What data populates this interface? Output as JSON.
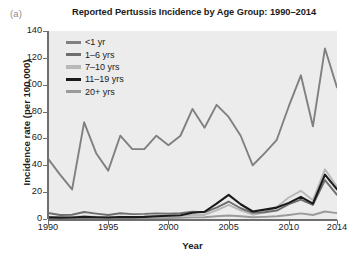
{
  "panel_label": "(a)",
  "axis": {
    "ylabel": "Incidence rate (per 100,000)",
    "xlabel": "Year",
    "yticks": [
      "0",
      "20",
      "40",
      "60",
      "80",
      "100",
      "120",
      "140"
    ],
    "xticks": [
      "1990",
      "1995",
      "2000",
      "2005",
      "2010",
      "2014"
    ]
  },
  "chart_data": {
    "type": "line",
    "title": "Reported Pertussis Incidence by Age Group: 1990–2014",
    "xlabel": "Year",
    "ylabel": "Incidence rate (per 100,000)",
    "xlim": [
      1990,
      2014
    ],
    "ylim": [
      0,
      140
    ],
    "ytick_step": 20,
    "grid": false,
    "legend_position": "top-left-inside",
    "plot_background": "#ececec",
    "x": [
      1990,
      1991,
      1992,
      1993,
      1994,
      1995,
      1996,
      1997,
      1998,
      1999,
      2000,
      2001,
      2002,
      2003,
      2004,
      2005,
      2006,
      2007,
      2008,
      2009,
      2010,
      2011,
      2012,
      2013,
      2014
    ],
    "series": [
      {
        "name": "<1 yr",
        "color": "#808080",
        "values": [
          45,
          33,
          22,
          72,
          49,
          36,
          62,
          52,
          52,
          62,
          55,
          62,
          82,
          68,
          85,
          76,
          62,
          40,
          49,
          59,
          84,
          107,
          69,
          127,
          98
        ]
      },
      {
        "name": "1–6 yrs",
        "color": "#6e6e6e",
        "values": [
          4.5,
          3.0,
          3.2,
          5.2,
          4.0,
          3.0,
          4.3,
          3.6,
          3.8,
          4.2,
          4.0,
          4.4,
          5.4,
          5.0,
          8.4,
          13.0,
          8.0,
          4.6,
          5.0,
          6.3,
          11.0,
          14.5,
          10.5,
          29.0,
          18.0
        ]
      },
      {
        "name": "7–10 yrs",
        "color": "#b8b8b8",
        "values": [
          1.6,
          1.3,
          1.3,
          2.0,
          1.6,
          1.4,
          1.8,
          1.6,
          1.7,
          1.9,
          2.0,
          2.3,
          3.0,
          3.0,
          6.5,
          10.5,
          6.5,
          3.2,
          5.0,
          9.0,
          16.0,
          21.0,
          14.0,
          37.0,
          24.0
        ]
      },
      {
        "name": "11–19 yrs",
        "color": "#1a1a1a",
        "values": [
          1.2,
          1.0,
          1.1,
          1.6,
          1.3,
          1.1,
          1.5,
          1.4,
          1.6,
          2.0,
          2.4,
          2.8,
          4.6,
          5.4,
          11.5,
          18.0,
          11.0,
          5.6,
          7.0,
          8.5,
          12.0,
          16.5,
          11.5,
          33.0,
          22.0
        ]
      },
      {
        "name": "20+ yrs",
        "color": "#9a9a9a",
        "values": [
          0.4,
          0.3,
          0.3,
          0.5,
          0.4,
          0.4,
          0.5,
          0.5,
          0.6,
          0.7,
          0.8,
          0.9,
          1.2,
          1.3,
          2.0,
          2.6,
          2.0,
          1.3,
          1.6,
          2.0,
          3.0,
          4.2,
          3.0,
          5.6,
          4.4
        ]
      }
    ]
  }
}
